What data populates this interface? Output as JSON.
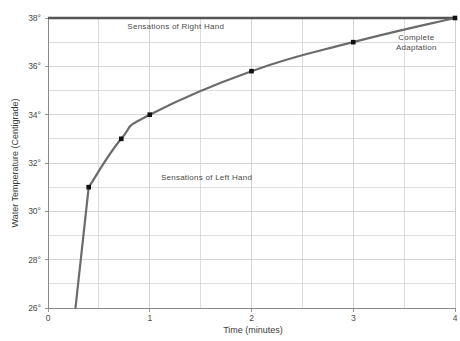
{
  "chart_data": {
    "type": "line",
    "title": "",
    "subtitle": "",
    "xlabel": "Time (minutes)",
    "ylabel": "Water Temperature (Centigrade)",
    "xlim": [
      0,
      4
    ],
    "ylim": [
      26,
      38
    ],
    "grid": true,
    "x_ticks": [
      "0",
      "1",
      "2",
      "3",
      "4"
    ],
    "x_tick_values": [
      0,
      1,
      2,
      3,
      4
    ],
    "x_minor_step": 0.5,
    "y_ticks": [
      "26°",
      "28°",
      "30°",
      "32°",
      "34°",
      "36°",
      "38°"
    ],
    "y_tick_values": [
      26,
      28,
      30,
      32,
      34,
      36,
      38
    ],
    "y_minor_step": 1,
    "legend": "none",
    "series": [
      {
        "name": "Adaptation curve",
        "color": "#6b6b6b",
        "marker": "square",
        "marker_color": "#111111",
        "x": [
          0.27,
          0.4,
          0.72,
          1.0,
          2.0,
          3.0,
          4.0
        ],
        "y": [
          26.0,
          31.0,
          33.0,
          34.0,
          35.8,
          37.0,
          38.0
        ],
        "labeled_points_x": [
          0.4,
          0.72,
          1.0,
          2.0,
          3.0,
          4.0
        ],
        "labeled_points_y": [
          31.0,
          33.0,
          34.0,
          35.8,
          37.0,
          38.0
        ]
      },
      {
        "name": "Body temperature reference",
        "color": "#555555",
        "marker": "none",
        "x": [
          0,
          4
        ],
        "y": [
          38.0,
          38.0
        ]
      }
    ],
    "annotations": [
      {
        "text": "Sensations of Right Hand",
        "x": 0.78,
        "y": 37.55
      },
      {
        "text": "Sensations of Left Hand",
        "x": 1.11,
        "y": 31.3
      },
      {
        "text": "Complete",
        "x": 3.62,
        "y": 37.1
      },
      {
        "text": "Adaptation",
        "x": 3.62,
        "y": 36.67
      }
    ]
  },
  "axes": {
    "x_title": "Time (minutes)",
    "y_title": "Water Temperature (Centigrade)"
  },
  "colors": {
    "curve": "#6b6b6b",
    "marker": "#111111",
    "reference_line": "#555555",
    "grid": "#cfcfcf",
    "axis": "#8a8a8a",
    "text": "#4a4a4a",
    "background": "#ffffff"
  }
}
